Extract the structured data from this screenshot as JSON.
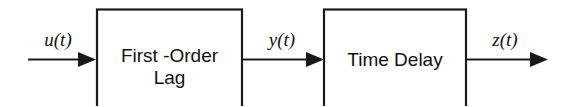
{
  "diagram": {
    "background_color": "#ffffff",
    "line_color": "#1a1a1a",
    "text_color": "#111111",
    "blocks": [
      {
        "id": "first-order-lag",
        "line1": "First -Order",
        "line2": "Lag"
      },
      {
        "id": "time-delay",
        "line1": "Time Delay",
        "line2": ""
      }
    ],
    "signals": [
      {
        "id": "input",
        "label": "u(t)"
      },
      {
        "id": "intermediate",
        "label": "y(t)"
      },
      {
        "id": "output",
        "label": "z(t)"
      }
    ]
  }
}
